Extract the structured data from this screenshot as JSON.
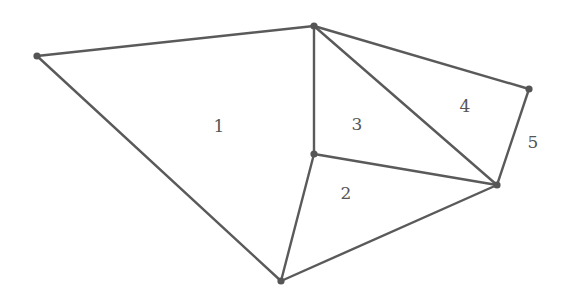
{
  "diagram": {
    "type": "planar-graph-triangulation",
    "colors": {
      "edge": "#5a5a5a",
      "vertex": "#555555",
      "label": "#555555",
      "background": "#ffffff"
    },
    "vertices": [
      {
        "id": "A",
        "x": 37,
        "y": 56
      },
      {
        "id": "B",
        "x": 314,
        "y": 26
      },
      {
        "id": "C",
        "x": 529,
        "y": 89
      },
      {
        "id": "D",
        "x": 314,
        "y": 154
      },
      {
        "id": "E",
        "x": 497,
        "y": 185
      },
      {
        "id": "F",
        "x": 281,
        "y": 281
      }
    ],
    "edges": [
      {
        "from": "A",
        "to": "B"
      },
      {
        "from": "A",
        "to": "F"
      },
      {
        "from": "B",
        "to": "C"
      },
      {
        "from": "B",
        "to": "D"
      },
      {
        "from": "B",
        "to": "E"
      },
      {
        "from": "C",
        "to": "E"
      },
      {
        "from": "D",
        "to": "E"
      },
      {
        "from": "D",
        "to": "F"
      },
      {
        "from": "E",
        "to": "F"
      }
    ],
    "labels": [
      {
        "text": "1",
        "x": 219,
        "y": 127
      },
      {
        "text": "2",
        "x": 346,
        "y": 194
      },
      {
        "text": "3",
        "x": 357,
        "y": 125
      },
      {
        "text": "4",
        "x": 465,
        "y": 107
      },
      {
        "text": "5",
        "x": 533,
        "y": 143
      }
    ]
  }
}
